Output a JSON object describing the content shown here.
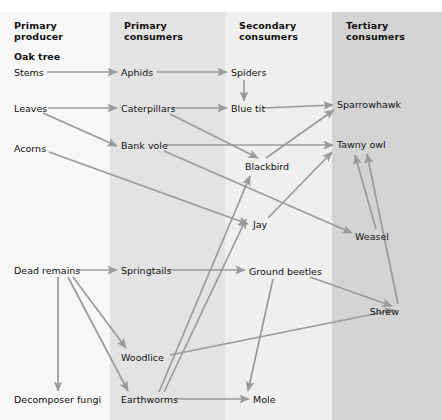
{
  "diagram": {
    "type": "food-web",
    "line_color": "#9a9a9a",
    "text_color": "#111111"
  },
  "columns": [
    {
      "id": "primary-producer",
      "label": "Primary\nproducer",
      "x": 0,
      "width": 110,
      "color": "#f7f7f7"
    },
    {
      "id": "primary-consumers",
      "label": "Primary\nconsumers",
      "x": 110,
      "width": 115,
      "color": "#e3e3e3"
    },
    {
      "id": "secondary-consumers",
      "label": "Secondary\nconsumers",
      "x": 225,
      "width": 107,
      "color": "#efefef"
    },
    {
      "id": "tertiary-consumers",
      "label": "Tertiary\nconsumers",
      "x": 332,
      "width": 110,
      "color": "#d4d4d4"
    }
  ],
  "nodes": [
    {
      "id": "oak-tree",
      "label": "Oak tree",
      "x": 14,
      "y": 56,
      "bold": true,
      "column": "primary-producer"
    },
    {
      "id": "stems",
      "label": "Stems",
      "x": 14,
      "y": 72,
      "bold": false,
      "column": "primary-producer"
    },
    {
      "id": "leaves",
      "label": "Leaves",
      "x": 14,
      "y": 108,
      "bold": false,
      "column": "primary-producer"
    },
    {
      "id": "acorns",
      "label": "Acorns",
      "x": 14,
      "y": 148,
      "bold": false,
      "column": "primary-producer"
    },
    {
      "id": "dead-remains",
      "label": "Dead remains",
      "x": 14,
      "y": 270,
      "bold": false,
      "column": "primary-producer"
    },
    {
      "id": "decomposer-fungi",
      "label": "Decomposer fungi",
      "x": 14,
      "y": 399,
      "bold": false,
      "column": "primary-producer"
    },
    {
      "id": "aphids",
      "label": "Aphids",
      "x": 121,
      "y": 72,
      "bold": false,
      "column": "primary-consumers"
    },
    {
      "id": "caterpillars",
      "label": "Caterpillars",
      "x": 121,
      "y": 108,
      "bold": false,
      "column": "primary-consumers"
    },
    {
      "id": "bank-vole",
      "label": "Bank vole",
      "x": 121,
      "y": 145,
      "bold": false,
      "column": "primary-consumers"
    },
    {
      "id": "springtails",
      "label": "Springtails",
      "x": 121,
      "y": 270,
      "bold": false,
      "column": "primary-consumers"
    },
    {
      "id": "woodlice",
      "label": "Woodlice",
      "x": 121,
      "y": 357,
      "bold": false,
      "column": "primary-consumers"
    },
    {
      "id": "earthworms",
      "label": "Earthworms",
      "x": 121,
      "y": 399,
      "bold": false,
      "column": "primary-consumers"
    },
    {
      "id": "spiders",
      "label": "Spiders",
      "x": 231,
      "y": 72,
      "bold": false,
      "column": "secondary-consumers"
    },
    {
      "id": "blue-tit",
      "label": "Blue tit",
      "x": 231,
      "y": 108,
      "bold": false,
      "column": "secondary-consumers"
    },
    {
      "id": "blackbird",
      "label": "Blackbird",
      "x": 245,
      "y": 166,
      "bold": false,
      "column": "secondary-consumers"
    },
    {
      "id": "jay",
      "label": "Jay",
      "x": 253,
      "y": 224,
      "bold": false,
      "column": "secondary-consumers"
    },
    {
      "id": "ground-beetles",
      "label": "Ground beetles",
      "x": 249,
      "y": 271,
      "bold": false,
      "column": "secondary-consumers"
    },
    {
      "id": "mole",
      "label": "Mole",
      "x": 253,
      "y": 399,
      "bold": false,
      "column": "secondary-consumers"
    },
    {
      "id": "sparrowhawk",
      "label": "Sparrowhawk",
      "x": 337,
      "y": 104,
      "bold": false,
      "column": "tertiary-consumers"
    },
    {
      "id": "tawny-owl",
      "label": "Tawny owl",
      "x": 337,
      "y": 144,
      "bold": false,
      "column": "tertiary-consumers"
    },
    {
      "id": "weasel",
      "label": "Weasel",
      "x": 355,
      "y": 236,
      "bold": false,
      "column": "tertiary-consumers"
    },
    {
      "id": "shrew",
      "label": "Shrew",
      "x": 399,
      "y": 311,
      "bold": false,
      "column": "tertiary-consumers"
    }
  ],
  "links": [
    {
      "from": "stems",
      "to": "aphids",
      "x1": 47,
      "y1": 72,
      "x2": 117,
      "y2": 72
    },
    {
      "from": "aphids",
      "to": "spiders",
      "x1": 157,
      "y1": 72,
      "x2": 227,
      "y2": 72
    },
    {
      "from": "spiders",
      "to": "blue-tit",
      "x1": 244,
      "y1": 80,
      "x2": 244,
      "y2": 101
    },
    {
      "from": "leaves",
      "to": "caterpillars",
      "x1": 48,
      "y1": 108,
      "x2": 117,
      "y2": 108
    },
    {
      "from": "leaves",
      "to": "bank-vole",
      "x1": 43,
      "y1": 113,
      "x2": 117,
      "y2": 146
    },
    {
      "from": "acorns",
      "to": "jay",
      "x1": 49,
      "y1": 152,
      "x2": 248,
      "y2": 224
    },
    {
      "from": "caterpillars",
      "to": "blue-tit",
      "x1": 172,
      "y1": 108,
      "x2": 227,
      "y2": 108
    },
    {
      "from": "caterpillars",
      "to": "blackbird",
      "x1": 170,
      "y1": 114,
      "x2": 258,
      "y2": 158
    },
    {
      "from": "blue-tit",
      "to": "sparrowhawk",
      "x1": 263,
      "y1": 108,
      "x2": 333,
      "y2": 105
    },
    {
      "from": "bank-vole",
      "to": "tawny-owl",
      "x1": 166,
      "y1": 145,
      "x2": 333,
      "y2": 145
    },
    {
      "from": "bank-vole",
      "to": "weasel",
      "x1": 164,
      "y1": 151,
      "x2": 352,
      "y2": 233
    },
    {
      "from": "blackbird",
      "to": "sparrowhawk",
      "x1": 266,
      "y1": 158,
      "x2": 334,
      "y2": 110
    },
    {
      "from": "jay",
      "to": "tawny-owl",
      "x1": 268,
      "y1": 218,
      "x2": 332,
      "y2": 152
    },
    {
      "from": "dead-remains",
      "to": "springtails",
      "x1": 78,
      "y1": 270,
      "x2": 117,
      "y2": 270
    },
    {
      "from": "dead-remains",
      "to": "decomposer-fungi",
      "x1": 58,
      "y1": 277,
      "x2": 58,
      "y2": 391
    },
    {
      "from": "dead-remains",
      "to": "woodlice",
      "x1": 73,
      "y1": 277,
      "x2": 126,
      "y2": 348
    },
    {
      "from": "dead-remains",
      "to": "earthworms",
      "x1": 68,
      "y1": 277,
      "x2": 128,
      "y2": 391
    },
    {
      "from": "springtails",
      "to": "ground-beetles",
      "x1": 168,
      "y1": 270,
      "x2": 245,
      "y2": 270
    },
    {
      "from": "earthworms",
      "to": "mole",
      "x1": 175,
      "y1": 399,
      "x2": 249,
      "y2": 399
    },
    {
      "from": "earthworms",
      "to": "blackbird",
      "x1": 159,
      "y1": 392,
      "x2": 250,
      "y2": 176
    },
    {
      "from": "earthworms",
      "to": "jay",
      "x1": 164,
      "y1": 392,
      "x2": 246,
      "y2": 219
    },
    {
      "from": "woodlice",
      "to": "shrew",
      "x1": 170,
      "y1": 355,
      "x2": 394,
      "y2": 310
    },
    {
      "from": "ground-beetles",
      "to": "shrew",
      "x1": 310,
      "y1": 277,
      "x2": 392,
      "y2": 306
    },
    {
      "from": "ground-beetles",
      "to": "mole",
      "x1": 273,
      "y1": 279,
      "x2": 248,
      "y2": 391
    },
    {
      "from": "weasel",
      "to": "tawny-owl",
      "x1": 376,
      "y1": 229,
      "x2": 355,
      "y2": 155
    },
    {
      "from": "shrew",
      "to": "tawny-owl",
      "x1": 398,
      "y1": 304,
      "x2": 367,
      "y2": 154
    }
  ]
}
